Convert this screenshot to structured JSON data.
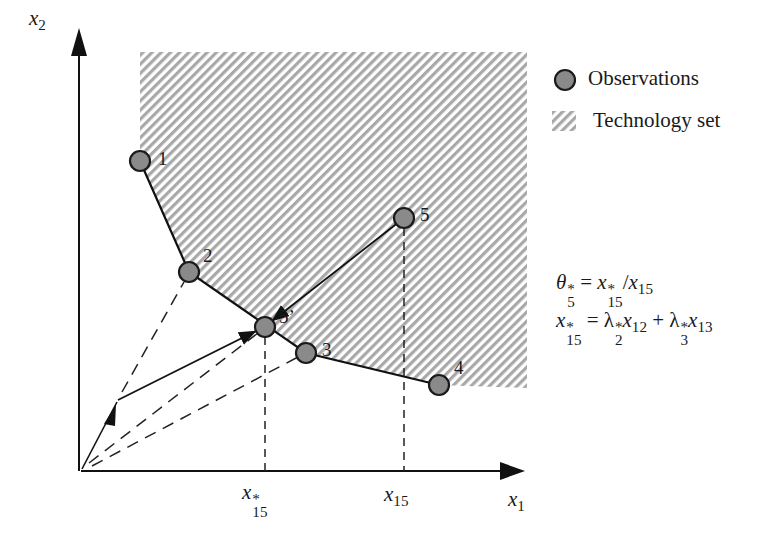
{
  "axes": {
    "x_label": {
      "var": "x",
      "sub": "1"
    },
    "y_label": {
      "var": "x",
      "sub": "2"
    },
    "origin": [
      81,
      471
    ],
    "x_end": [
      523,
      471
    ],
    "y_end": [
      79,
      30
    ]
  },
  "technology_set": {
    "polygon": [
      [
        140,
        52
      ],
      [
        527,
        52
      ],
      [
        527,
        388
      ],
      [
        439,
        385
      ],
      [
        306,
        353
      ],
      [
        189,
        272
      ],
      [
        140,
        161
      ]
    ],
    "hatch_color": "#a8a8a8"
  },
  "observations": [
    {
      "id": "1",
      "label": "1",
      "cx": 140,
      "cy": 161,
      "label_x": 158,
      "label_y": 148
    },
    {
      "id": "2",
      "label": "2",
      "cx": 189,
      "cy": 272,
      "label_x": 203,
      "label_y": 246
    },
    {
      "id": "3",
      "label": "3",
      "cx": 306,
      "cy": 353,
      "label_x": 322,
      "label_y": 340
    },
    {
      "id": "4",
      "label": "4",
      "cx": 439,
      "cy": 385,
      "label_x": 454,
      "label_y": 358
    },
    {
      "id": "5",
      "label": "5",
      "cx": 404,
      "cy": 218,
      "label_x": 420,
      "label_y": 205
    },
    {
      "id": "5p",
      "label": "5’",
      "cx": 265,
      "cy": 327,
      "label_x": 279,
      "label_y": 307
    }
  ],
  "observation_style": {
    "fill": "#8a8a8a",
    "stroke": "#1a1a1a",
    "radius": 10
  },
  "frontier": {
    "points": [
      [
        140,
        161
      ],
      [
        189,
        272
      ],
      [
        306,
        353
      ],
      [
        439,
        385
      ]
    ]
  },
  "projection": {
    "from": [
      404,
      218
    ],
    "to": [
      265,
      327
    ]
  },
  "combination_arrows": {
    "segment_1": {
      "from": [
        81,
        471
      ],
      "to": [
        118,
        400
      ]
    },
    "segment_2": {
      "from": [
        118,
        400
      ],
      "to": [
        265,
        327
      ]
    }
  },
  "dashed_rays": [
    {
      "from": [
        81,
        471
      ],
      "to": [
        262,
        330
      ]
    },
    {
      "from": [
        81,
        471
      ],
      "to": [
        306,
        353
      ]
    },
    {
      "from": [
        118,
        400
      ],
      "to": [
        189,
        272
      ]
    }
  ],
  "drop_lines": [
    {
      "x": 265,
      "from_y": 337,
      "to_y": 471
    },
    {
      "x": 404,
      "from_y": 228,
      "to_y": 471
    }
  ],
  "ticks": {
    "x15_star": {
      "var": "x",
      "sup": "*",
      "sub": "15",
      "x": 244,
      "y": 484
    },
    "x15": {
      "var": "x",
      "sub": "15",
      "x": 385,
      "y": 484
    },
    "x1": {
      "var": "x",
      "sub": "1",
      "x": 509,
      "y": 490
    }
  },
  "legend": {
    "items": [
      {
        "type": "circle",
        "label": "Observations"
      },
      {
        "type": "hatch",
        "label": "Technology set"
      }
    ]
  },
  "equations": {
    "eq1": {
      "lhs": {
        "var": "θ",
        "sup": "*",
        "sub": "5"
      },
      "op": " = ",
      "rhs_a": {
        "var": "x",
        "sup": "*",
        "sub": "15"
      },
      "slash": "/",
      "rhs_b": {
        "var": "x",
        "sub": "15"
      }
    },
    "eq2": {
      "lhs": {
        "var": "x",
        "sup": "*",
        "sub": "15"
      },
      "op": " = ",
      "t1_coef": {
        "var": "λ",
        "sup": "*",
        "sub": "2"
      },
      "t1_x": {
        "var": "x",
        "sub": "12"
      },
      "plus": " + ",
      "t2_coef": {
        "var": "λ",
        "sup": "*",
        "sub": "3"
      },
      "t2_x": {
        "var": "x",
        "sub": "13"
      }
    }
  }
}
